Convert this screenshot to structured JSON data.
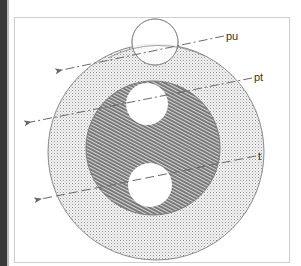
{
  "diagram": {
    "type": "concentric-circles-with-trajectories",
    "labels": {
      "pu": "pu",
      "pt": "pt",
      "t": "t"
    },
    "regions": [
      {
        "name": "outer-ring",
        "fill": "dotted",
        "color": "#c8c8c8"
      },
      {
        "name": "inner-disc",
        "fill": "hatched",
        "color": "#8a8a8a"
      },
      {
        "name": "top-circle",
        "fill": "white-outline"
      },
      {
        "name": "middle-circle",
        "fill": "white"
      },
      {
        "name": "bottom-circle",
        "fill": "white"
      }
    ],
    "lines": [
      {
        "label": "pu",
        "style": "dash-dot",
        "arrow": "left"
      },
      {
        "label": "pt",
        "style": "dash-dot",
        "arrow": "left"
      },
      {
        "label": "t",
        "style": "dashed",
        "arrow": "left"
      }
    ],
    "colors": {
      "frame": "#cfcfcf",
      "stroke": "#7a7a7a",
      "hatch": "#7f7f7f",
      "dots": "#9a9a9a",
      "left_bar": "#3a3a3a"
    }
  }
}
